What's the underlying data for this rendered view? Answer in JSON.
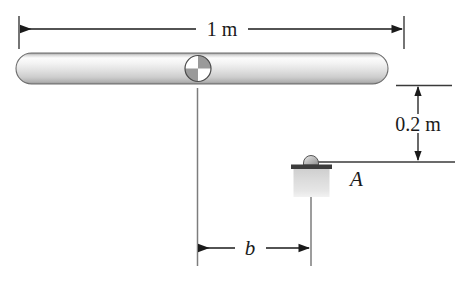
{
  "figure": {
    "background_color": "#ffffff",
    "line_color": "#1a1a1a",
    "bar": {
      "label": "horizontal-rod",
      "fill_light": "#fbfbfb",
      "fill_mid": "#e3e3e3",
      "fill_dark": "#b4b4b4",
      "edge_color": "#6e6e6e"
    },
    "pivot": {
      "label": "pivot-quadrant-circle",
      "white_quadrants": "top-left, bottom-right",
      "gray_quadrants": "top-right, bottom-left",
      "gray_color": "#9a9a9a",
      "white_color": "#ffffff",
      "edge_color": "#4a4a4a"
    },
    "block": {
      "label": "block-A",
      "body_fill": "#d8d8d8",
      "plate_fill": "#3c3c3c",
      "knob_fill": "#b0b0b0"
    }
  },
  "dimensions": {
    "span": {
      "name": "rod-length",
      "text": "1 m",
      "orientation": "horizontal",
      "value": 1,
      "unit": "m"
    },
    "drop": {
      "name": "vertical-offset",
      "text": "0.2 m",
      "orientation": "vertical",
      "value": 0.2,
      "unit": "m"
    },
    "offset": {
      "name": "horizontal-offset-b",
      "text": "b",
      "orientation": "horizontal",
      "value": null,
      "unit": ""
    }
  },
  "labels": {
    "block_label": "A"
  }
}
